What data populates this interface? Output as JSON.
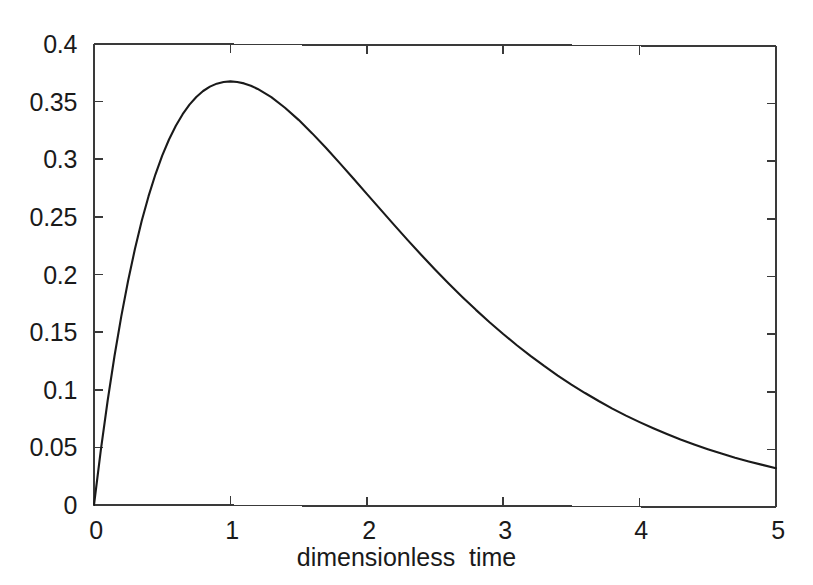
{
  "chart_data": {
    "type": "line",
    "title": "",
    "subtitle": "",
    "xlabel": "dimensionless  time",
    "ylabel": "",
    "xlim": [
      0,
      5
    ],
    "ylim": [
      0,
      0.4
    ],
    "grid": false,
    "legend": null,
    "legend_position": "none",
    "line_color": "#1a1a1a",
    "background_color": "#ffffff",
    "axis_color": "#3a3a3a",
    "xticks": [
      {
        "value": 0,
        "label": "0"
      },
      {
        "value": 1,
        "label": "1"
      },
      {
        "value": 2,
        "label": "2"
      },
      {
        "value": 3,
        "label": "3"
      },
      {
        "value": 4,
        "label": "4"
      },
      {
        "value": 5,
        "label": "5"
      }
    ],
    "yticks": [
      {
        "value": 0,
        "label": "0"
      },
      {
        "value": 0.05,
        "label": "0.05"
      },
      {
        "value": 0.1,
        "label": "0.1"
      },
      {
        "value": 0.15,
        "label": "0.15"
      },
      {
        "value": 0.2,
        "label": "0.2"
      },
      {
        "value": 0.25,
        "label": "0.25"
      },
      {
        "value": 0.3,
        "label": "0.3"
      },
      {
        "value": 0.35,
        "label": "0.35"
      },
      {
        "value": 0.4,
        "label": "0.4"
      }
    ],
    "series": [
      {
        "name": "response",
        "x": [
          0.0,
          0.05,
          0.1,
          0.15,
          0.2,
          0.25,
          0.3,
          0.35,
          0.4,
          0.45,
          0.5,
          0.55,
          0.6,
          0.65,
          0.7,
          0.75,
          0.8,
          0.85,
          0.9,
          0.95,
          1.0,
          1.05,
          1.1,
          1.15,
          1.2,
          1.3,
          1.4,
          1.5,
          1.6,
          1.7,
          1.8,
          1.9,
          2.0,
          2.1,
          2.2,
          2.3,
          2.4,
          2.5,
          2.6,
          2.7,
          2.8,
          2.9,
          3.0,
          3.1,
          3.2,
          3.3,
          3.4,
          3.5,
          3.6,
          3.7,
          3.8,
          3.9,
          4.0,
          4.1,
          4.2,
          4.3,
          4.4,
          4.5,
          4.6,
          4.7,
          4.8,
          4.9,
          5.0
        ],
        "y": [
          0.0,
          0.0476,
          0.0905,
          0.1291,
          0.1637,
          0.1947,
          0.2222,
          0.2467,
          0.2681,
          0.2869,
          0.3033,
          0.3173,
          0.3293,
          0.3393,
          0.3476,
          0.3543,
          0.3595,
          0.3633,
          0.3659,
          0.3674,
          0.3679,
          0.3674,
          0.3662,
          0.3642,
          0.3614,
          0.3543,
          0.3452,
          0.3347,
          0.323,
          0.3106,
          0.2975,
          0.2842,
          0.2707,
          0.2572,
          0.2438,
          0.2306,
          0.2177,
          0.2052,
          0.1931,
          0.1815,
          0.1703,
          0.1596,
          0.1494,
          0.1397,
          0.1305,
          0.1218,
          0.1135,
          0.1057,
          0.0984,
          0.0915,
          0.085,
          0.0789,
          0.0733,
          0.068,
          0.063,
          0.0583,
          0.054,
          0.05,
          0.0462,
          0.0427,
          0.0395,
          0.0365,
          0.0337
        ]
      }
    ],
    "annotations": [
      {
        "kind": "peak",
        "x": 1.0,
        "y": 0.3679
      }
    ]
  },
  "axes": {
    "box_left_px": 94,
    "box_right_px": 776,
    "box_top_px": 44,
    "box_bottom_px": 505,
    "tick_direction": "in",
    "frame": "box"
  }
}
